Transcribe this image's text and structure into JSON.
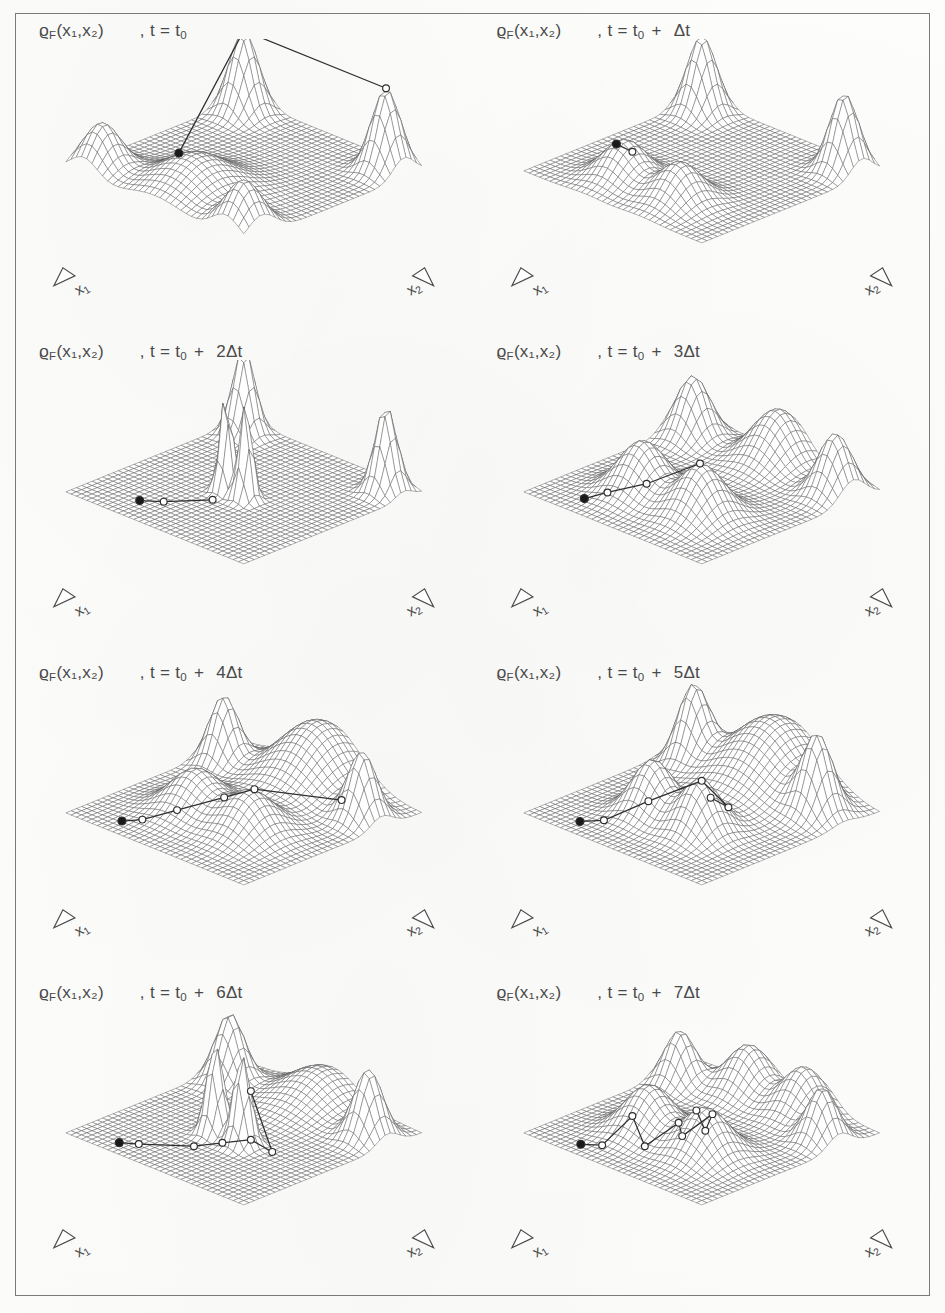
{
  "figure": {
    "kind": "multi-panel-3d-surface-series",
    "quantity_symbol": "ϱ",
    "quantity_subscript": "F",
    "quantity_args": "(x₁,x₂)",
    "panel_count": 8,
    "columns": 2,
    "rows": 4,
    "axis_x1_label": "x",
    "axis_x1_sub": "1",
    "axis_x2_label": "x",
    "axis_x2_sub": "2",
    "ink_color": "#4a4a4a",
    "mesh_color": "#555555",
    "frame_color": "#7a7a7a",
    "paper_color": "#fdfdfc"
  },
  "panels": [
    {
      "id": "panel-1",
      "title_rho": "ϱ",
      "title_sub": "F",
      "title_args": "(x₁,x₂)",
      "time_prefix": ",   t  =  t",
      "time_sub": "0",
      "time_suffix": "",
      "time_label": "t = t₀",
      "step": 0,
      "step_multiplier": "",
      "trajectory_markers": 1,
      "description": "four corner ridges, single broad front bump, filled start marker"
    },
    {
      "id": "panel-2",
      "title_rho": "ϱ",
      "title_sub": "F",
      "title_args": "(x₁,x₂)",
      "time_prefix": ",   t  =  t",
      "time_sub": "0",
      "time_suffix": "+  Δt",
      "time_label": "t = t₀ + Δt",
      "step": 1,
      "step_multiplier": "",
      "trajectory_markers": 2,
      "description": "two front bumps separating, short trajectory segment"
    },
    {
      "id": "panel-3",
      "title_rho": "ϱ",
      "title_sub": "F",
      "title_args": "(x₁,x₂)",
      "time_prefix": ",   t  =  t",
      "time_sub": "0",
      "time_suffix": "+  2Δt",
      "time_label": "t = t₀ + 2Δt",
      "step": 2,
      "step_multiplier": "2",
      "trajectory_markers": 3,
      "description": "tall narrow central twin spikes, trajectory reaching spike base"
    },
    {
      "id": "panel-4",
      "title_rho": "ϱ",
      "title_sub": "F",
      "title_args": "(x₁,x₂)",
      "time_prefix": ",   t  =  t",
      "time_sub": "0",
      "time_suffix": "+  3Δt",
      "time_label": "t = t₀ + 3Δt",
      "step": 3,
      "step_multiplier": "3",
      "trajectory_markers": 4,
      "description": "two rounded front bumps, rippled back ridge, long trajectory"
    },
    {
      "id": "panel-5",
      "title_rho": "ϱ",
      "title_sub": "F",
      "title_args": "(x₁,x₂)",
      "time_prefix": ",   t  =  t",
      "time_sub": "0",
      "time_suffix": "+  4Δt",
      "time_label": "t = t₀ + 4Δt",
      "step": 4,
      "step_multiplier": "4",
      "trajectory_markers": 6,
      "description": "broad back plateau ridge, trajectory climbing to right ridge"
    },
    {
      "id": "panel-6",
      "title_rho": "ϱ",
      "title_sub": "F",
      "title_args": "(x₁,x₂)",
      "time_prefix": ",   t  =  t",
      "time_sub": "0",
      "time_suffix": "+  5Δt",
      "time_label": "t = t₀ + 5Δt",
      "step": 5,
      "step_multiplier": "5",
      "trajectory_markers": 6,
      "description": "high back wall, two central bumps, trajectory with return hook"
    },
    {
      "id": "panel-7",
      "title_rho": "ϱ",
      "title_sub": "F",
      "title_args": "(x₁,x₂)",
      "time_prefix": ",   t  =  t",
      "time_sub": "0",
      "time_suffix": "+  6Δt",
      "time_label": "t = t₀ + 6Δt",
      "step": 6,
      "step_multiplier": "6",
      "trajectory_markers": 7,
      "description": "sharp central twin spikes again, trajectory crossing the spikes"
    },
    {
      "id": "panel-8",
      "title_rho": "ϱ",
      "title_sub": "F",
      "title_args": "(x₁,x₂)",
      "time_prefix": ",   t  =  t",
      "time_sub": "0",
      "time_suffix": "+  7Δt",
      "time_label": "t = t₀ + 7Δt",
      "step": 7,
      "step_multiplier": "7",
      "trajectory_markers": 9,
      "description": "two smooth front bumps, closed loop trajectory with many markers"
    }
  ],
  "chart_data": {
    "type": "surface",
    "xlabel": "x₁",
    "ylabel": "x₂",
    "zlabel": "ϱ_F",
    "grid": true,
    "legend": "none",
    "projection": "isometric-wireframe",
    "mesh_n": 34,
    "time_steps": [
      "t₀",
      "t₀ + Δt",
      "t₀ + 2Δt",
      "t₀ + 3Δt",
      "t₀ + 4Δt",
      "t₀ + 5Δt",
      "t₀ + 6Δt",
      "t₀ + 7Δt"
    ],
    "surfaces": [
      {
        "step": 0,
        "peaks": [
          {
            "x": -0.8,
            "y": -0.8,
            "h": 0.95,
            "w": 0.17
          },
          {
            "x": 0.8,
            "y": -0.8,
            "h": 0.95,
            "w": 0.17
          },
          {
            "x": -0.8,
            "y": 0.8,
            "h": 0.55,
            "w": 0.22
          },
          {
            "x": 0.8,
            "y": 0.8,
            "h": 0.55,
            "w": 0.22
          },
          {
            "x": 0.0,
            "y": 0.55,
            "h": 0.42,
            "w": 0.42
          }
        ],
        "markers": [
          {
            "x": -0.18,
            "y": 0.55,
            "filled": true
          },
          {
            "x": -0.8,
            "y": -0.8,
            "filled": false
          },
          {
            "x": 0.8,
            "y": -0.8,
            "filled": false
          }
        ]
      },
      {
        "step": 1,
        "peaks": [
          {
            "x": -0.8,
            "y": -0.8,
            "h": 0.9,
            "w": 0.17
          },
          {
            "x": 0.8,
            "y": -0.8,
            "h": 0.9,
            "w": 0.17
          },
          {
            "x": -0.32,
            "y": 0.55,
            "h": 0.45,
            "w": 0.26
          },
          {
            "x": 0.3,
            "y": 0.55,
            "h": 0.45,
            "w": 0.26
          }
        ],
        "markers": [
          {
            "x": -0.34,
            "y": 0.62,
            "filled": true
          },
          {
            "x": -0.2,
            "y": 0.58,
            "filled": false
          }
        ]
      },
      {
        "step": 2,
        "peaks": [
          {
            "x": -0.8,
            "y": -0.8,
            "h": 1.0,
            "w": 0.13
          },
          {
            "x": 0.8,
            "y": -0.8,
            "h": 1.0,
            "w": 0.13
          },
          {
            "x": -0.1,
            "y": 0.1,
            "h": 1.15,
            "w": 0.075
          },
          {
            "x": 0.12,
            "y": 0.1,
            "h": 1.15,
            "w": 0.075
          }
        ],
        "markers": [
          {
            "x": -0.45,
            "y": 0.72,
            "filled": true
          },
          {
            "x": -0.3,
            "y": 0.6,
            "filled": false
          },
          {
            "x": -0.05,
            "y": 0.3,
            "filled": false
          }
        ]
      },
      {
        "step": 3,
        "peaks": [
          {
            "x": -0.8,
            "y": -0.7,
            "h": 0.72,
            "w": 0.2
          },
          {
            "x": 0.8,
            "y": -0.7,
            "h": 0.72,
            "w": 0.2
          },
          {
            "x": 0.0,
            "y": -0.85,
            "h": 0.6,
            "w": 0.3
          },
          {
            "x": -0.32,
            "y": 0.35,
            "h": 0.6,
            "w": 0.28
          },
          {
            "x": 0.34,
            "y": 0.35,
            "h": 0.6,
            "w": 0.28
          }
        ],
        "markers": [
          {
            "x": -0.52,
            "y": 0.8,
            "filled": true
          },
          {
            "x": -0.36,
            "y": 0.7,
            "filled": false
          },
          {
            "x": -0.1,
            "y": 0.52,
            "filled": false
          },
          {
            "x": 0.28,
            "y": 0.3,
            "filled": false
          }
        ]
      },
      {
        "step": 4,
        "peaks": [
          {
            "x": -0.78,
            "y": -0.55,
            "h": 0.78,
            "w": 0.17
          },
          {
            "x": 0.78,
            "y": -0.55,
            "h": 0.78,
            "w": 0.17
          },
          {
            "x": 0.0,
            "y": -0.82,
            "h": 0.72,
            "w": 0.46
          },
          {
            "x": -0.3,
            "y": 0.25,
            "h": 0.48,
            "w": 0.3
          },
          {
            "x": 0.32,
            "y": 0.25,
            "h": 0.48,
            "w": 0.3
          }
        ],
        "markers": [
          {
            "x": -0.55,
            "y": 0.82,
            "filled": true
          },
          {
            "x": -0.42,
            "y": 0.72,
            "filled": false
          },
          {
            "x": -0.2,
            "y": 0.55,
            "filled": false
          },
          {
            "x": 0.1,
            "y": 0.32,
            "filled": false
          },
          {
            "x": 0.3,
            "y": 0.18,
            "filled": false
          },
          {
            "x": 0.72,
            "y": -0.38,
            "filled": false
          }
        ]
      },
      {
        "step": 5,
        "peaks": [
          {
            "x": -0.7,
            "y": -0.6,
            "h": 0.85,
            "w": 0.18
          },
          {
            "x": 0.7,
            "y": -0.6,
            "h": 0.85,
            "w": 0.18
          },
          {
            "x": 0.0,
            "y": -0.8,
            "h": 0.78,
            "w": 0.52
          },
          {
            "x": -0.26,
            "y": 0.3,
            "h": 0.62,
            "w": 0.24
          },
          {
            "x": 0.28,
            "y": 0.3,
            "h": 0.62,
            "w": 0.24
          }
        ],
        "markers": [
          {
            "x": -0.55,
            "y": 0.82,
            "filled": true
          },
          {
            "x": -0.4,
            "y": 0.7,
            "filled": false
          },
          {
            "x": -0.12,
            "y": 0.48,
            "filled": false
          },
          {
            "x": 0.22,
            "y": 0.22,
            "filled": false
          },
          {
            "x": 0.4,
            "y": 0.1,
            "filled": false
          },
          {
            "x": 0.18,
            "y": 0.08,
            "filled": false
          }
        ]
      },
      {
        "step": 6,
        "peaks": [
          {
            "x": -0.78,
            "y": -0.62,
            "h": 0.8,
            "w": 0.17
          },
          {
            "x": 0.78,
            "y": -0.62,
            "h": 0.8,
            "w": 0.17
          },
          {
            "x": 0.0,
            "y": -0.85,
            "h": 0.4,
            "w": 0.4
          },
          {
            "x": -0.14,
            "y": 0.18,
            "h": 1.05,
            "w": 0.1
          },
          {
            "x": 0.16,
            "y": 0.18,
            "h": 1.05,
            "w": 0.1
          }
        ],
        "markers": [
          {
            "x": -0.55,
            "y": 0.85,
            "filled": true
          },
          {
            "x": -0.42,
            "y": 0.76,
            "filled": false
          },
          {
            "x": -0.08,
            "y": 0.48,
            "filled": false
          },
          {
            "x": 0.1,
            "y": 0.34,
            "filled": false
          },
          {
            "x": 0.3,
            "y": 0.22,
            "filled": false
          },
          {
            "x": 0.44,
            "y": 0.12,
            "filled": false
          },
          {
            "x": 0.22,
            "y": 0.14,
            "filled": false
          }
        ]
      },
      {
        "step": 7,
        "peaks": [
          {
            "x": -0.8,
            "y": -0.55,
            "h": 0.62,
            "w": 0.18
          },
          {
            "x": 0.8,
            "y": -0.55,
            "h": 0.62,
            "w": 0.18
          },
          {
            "x": -0.3,
            "y": -0.82,
            "h": 0.55,
            "w": 0.26
          },
          {
            "x": 0.32,
            "y": -0.82,
            "h": 0.55,
            "w": 0.26
          },
          {
            "x": -0.3,
            "y": 0.3,
            "h": 0.55,
            "w": 0.28
          },
          {
            "x": 0.34,
            "y": 0.3,
            "h": 0.55,
            "w": 0.28
          }
        ],
        "markers": [
          {
            "x": -0.5,
            "y": 0.86,
            "filled": true
          },
          {
            "x": -0.34,
            "y": 0.78,
            "filled": false
          },
          {
            "x": -0.26,
            "y": 0.52,
            "filled": false
          },
          {
            "x": -0.02,
            "y": 0.62,
            "filled": false
          },
          {
            "x": 0.14,
            "y": 0.4,
            "filled": false
          },
          {
            "x": 0.3,
            "y": 0.52,
            "filled": false
          },
          {
            "x": 0.42,
            "y": 0.3,
            "filled": false
          },
          {
            "x": 0.46,
            "y": 0.42,
            "filled": false
          },
          {
            "x": 0.2,
            "y": 0.26,
            "filled": false
          }
        ]
      }
    ]
  }
}
